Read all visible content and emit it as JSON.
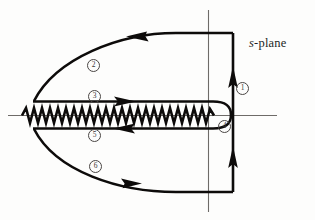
{
  "figure": {
    "plane_label_italic": "s",
    "plane_label_rest": "-plane"
  },
  "labels": {
    "segment_1": "1",
    "segment_2": "2",
    "segment_3": "3",
    "segment_4": "4",
    "segment_5": "5",
    "segment_6": "6"
  },
  "colors": {
    "contour": "#0d0b0a",
    "axis": "#6e6b68",
    "circle_label": "#3a3634",
    "background": "#fdfdfc",
    "text": "#231f1e"
  },
  "icons": {
    "arrow_top": "arrow-left-icon",
    "arrow_bottom": "arrow-right-icon",
    "arrow_upper_cut": "arrow-right-icon",
    "arrow_lower_cut": "arrow-left-icon",
    "arrow_right_upper": "arrow-up-icon",
    "arrow_right_lower": "arrow-up-icon",
    "branch_cut": "zigzag-branch-cut-icon",
    "real_axis": "horizontal-axis-icon",
    "imaginary_axis": "vertical-axis-icon"
  },
  "geometry": {
    "real_axis_y": 115,
    "imaginary_axis_x": 208,
    "contour_right_x": 233,
    "contour_top_y": 33,
    "contour_bottom_y": 192,
    "cut_left_x": 22,
    "branch_point_x": 215,
    "keyhole_upper_y": 103,
    "keyhole_lower_y": 127
  }
}
